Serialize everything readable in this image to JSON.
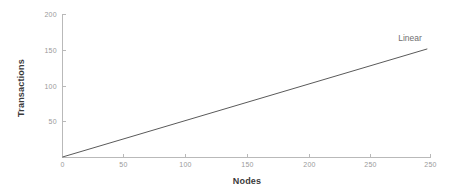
{
  "chart_data": {
    "type": "line",
    "title": "",
    "xlabel": "Nodes",
    "ylabel": "Transactions",
    "xlim": [
      0,
      300
    ],
    "ylim": [
      0,
      205
    ],
    "grid": false,
    "legend_position": "inline-annotation",
    "background_color": "#ffffff",
    "xticks": [
      0,
      50,
      100,
      150,
      200,
      250
    ],
    "xtick_labels": [
      "0",
      "50",
      "100",
      "150",
      "200",
      "250"
    ],
    "yticks": [
      0,
      50,
      100,
      150,
      200
    ],
    "ytick_labels": [
      "0",
      "50",
      "100",
      "150",
      "200"
    ],
    "series": [
      {
        "name": "Linear",
        "color": "#5a5a5a",
        "annotation": "Linear",
        "x": [
          0,
          297
        ],
        "values": [
          0,
          155
        ]
      }
    ],
    "annotations": [
      {
        "text": "Linear",
        "x": 250,
        "y": 172
      }
    ]
  },
  "axes": {
    "x_title": "Nodes",
    "y_title": "Transactions",
    "tick_color": "#9a9a9a",
    "axis_color": "#b9b9b9",
    "title_color": "#3b3b3b"
  },
  "ticks": {
    "x": [
      "0",
      "50",
      "100",
      "150",
      "200",
      "250"
    ],
    "y": [
      "200",
      "150",
      "100",
      "50",
      "0"
    ]
  },
  "series_label": "Linear"
}
